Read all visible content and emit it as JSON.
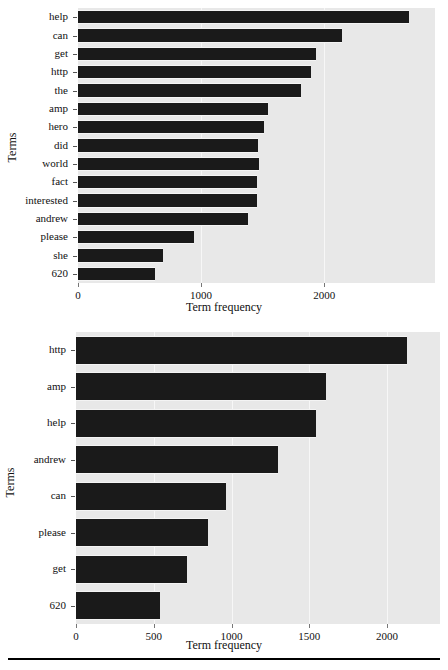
{
  "figure": {
    "background": "#ffffff",
    "plot_background": "#e8e8e8",
    "bar_color": "#1a1a1a",
    "grid_color": "#f7f7f7",
    "rule_label": "horizontal-rule"
  },
  "chart_data": [
    {
      "id": "top",
      "type": "bar",
      "orientation": "horizontal",
      "title": "",
      "xlabel": "Term frequency",
      "ylabel": "Terms",
      "categories": [
        "help",
        "can",
        "get",
        "http",
        "the",
        "amp",
        "hero",
        "did",
        "world",
        "fact",
        "interested",
        "andrew",
        "please",
        "she",
        "620"
      ],
      "values": [
        2690,
        2145,
        1930,
        1890,
        1810,
        1545,
        1510,
        1465,
        1470,
        1455,
        1455,
        1385,
        945,
        690,
        625
      ],
      "xticks": [
        0,
        1000,
        2000
      ],
      "xtick_labels": [
        "0",
        "1000",
        "2000"
      ],
      "xlim": [
        0,
        2900
      ],
      "grid": true,
      "legend": "none"
    },
    {
      "id": "bottom",
      "type": "bar",
      "orientation": "horizontal",
      "title": "",
      "xlabel": "Term frequency",
      "ylabel": "Terms",
      "categories": [
        "http",
        "amp",
        "help",
        "andrew",
        "can",
        "please",
        "get",
        "620"
      ],
      "values": [
        2130,
        1605,
        1540,
        1300,
        965,
        850,
        715,
        540
      ],
      "xticks": [
        0,
        500,
        1000,
        1500,
        2000
      ],
      "xtick_labels": [
        "0",
        "500",
        "1000",
        "1500",
        "2000"
      ],
      "xlim": [
        0,
        2340
      ],
      "grid": true,
      "legend": "none"
    }
  ]
}
